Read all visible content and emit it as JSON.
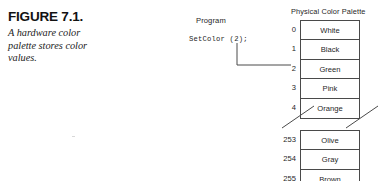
{
  "figure": {
    "label": "FIGURE 7.1.",
    "caption": "A hardware color palette stores color values."
  },
  "program": {
    "heading": "Program",
    "code": "SetColor (2);",
    "connector_target_index": "2"
  },
  "palette": {
    "title": "Physical Color Palette",
    "top_group": [
      {
        "index": "0",
        "color_name": "White"
      },
      {
        "index": "1",
        "color_name": "Black"
      },
      {
        "index": "2",
        "color_name": "Green"
      },
      {
        "index": "3",
        "color_name": "Pink"
      },
      {
        "index": "4",
        "color_name": "Orange"
      }
    ],
    "bottom_group": [
      {
        "index": "253",
        "color_name": "Olive"
      },
      {
        "index": "254",
        "color_name": "Gray"
      },
      {
        "index": "255",
        "color_name": "Brown"
      }
    ],
    "break_marker": "diagonal-break-slashes"
  },
  "colors": {
    "page_background": "#ffffff",
    "ink": "#1f1f1f",
    "rule": "#4a4a4a"
  }
}
